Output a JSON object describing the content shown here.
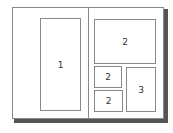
{
  "diagram": {
    "title": "",
    "left_page": {
      "panels": [
        {
          "label": "1"
        }
      ]
    },
    "right_page": {
      "panels": [
        {
          "label": "2"
        },
        {
          "label": "2"
        },
        {
          "label": "2"
        },
        {
          "label": "3"
        }
      ]
    }
  }
}
